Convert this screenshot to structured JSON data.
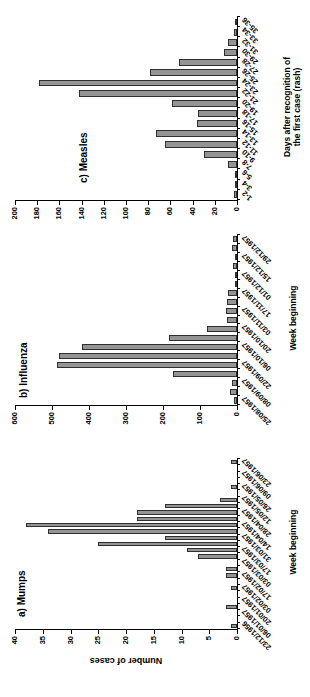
{
  "figure": {
    "y_axis_title": "Number of cases"
  },
  "chart_data": [
    {
      "type": "bar",
      "title": "a) Mumps",
      "xlabel": "Week beginning",
      "ylabel": "Number of cases",
      "ylim": [
        0,
        40
      ],
      "ytick_step": 5,
      "label_every": 2,
      "grid": false,
      "bar_color": "#949494",
      "categories": [
        "23/12/1956",
        "30/12/1956",
        "06/01/1957",
        "13/01/1957",
        "20/01/1957",
        "27/01/1957",
        "03/02/1957",
        "10/02/1957",
        "17/02/1957",
        "24/02/1957",
        "03/03/1957",
        "10/03/1957",
        "17/03/1957",
        "24/03/1957",
        "31/03/1957",
        "07/04/1957",
        "14/04/1957",
        "21/04/1957",
        "28/04/1957",
        "05/05/1957",
        "12/05/1957",
        "19/05/1957",
        "26/05/1957",
        "02/06/1957",
        "09/06/1957",
        "16/06/1957",
        "23/06/1957"
      ],
      "values": [
        1,
        0,
        0,
        2,
        0,
        0,
        1,
        0,
        2,
        2,
        0,
        7,
        9,
        25,
        13,
        34,
        38,
        18,
        18,
        13,
        3,
        0,
        1,
        0,
        0,
        0,
        1
      ]
    },
    {
      "type": "bar",
      "title": "b) Influenza",
      "xlabel": "Week beginning",
      "ylabel": "",
      "ylim": [
        0,
        600
      ],
      "ytick_step": 100,
      "label_every": 2,
      "grid": false,
      "bar_color": "#949494",
      "categories": [
        "25/08/1957",
        "01/09/1957",
        "08/09/1957",
        "15/09/1957",
        "22/09/1957",
        "29/09/1957",
        "06/10/1957",
        "13/10/1957",
        "20/10/1957",
        "27/10/1957",
        "03/11/1957",
        "10/11/1957",
        "17/11/1957",
        "24/11/1957",
        "01/12/1957",
        "08/12/1957",
        "15/12/1957",
        "22/12/1957",
        "29/12/1957"
      ],
      "values": [
        9,
        18,
        13,
        173,
        486,
        481,
        419,
        184,
        81,
        26,
        29,
        28,
        23,
        4,
        6,
        11,
        6,
        13,
        11
      ]
    },
    {
      "type": "bar",
      "title": "c) Measles",
      "xlabel_line1": "Days after recognition of",
      "xlabel_line2": "the first case (rash)",
      "ylabel": "",
      "ylim": [
        0,
        200
      ],
      "ytick_step": 20,
      "label_every": 1,
      "grid": false,
      "bar_color": "#949494",
      "categories": [
        "1-2",
        "3-4",
        "5-6",
        "7-8",
        "9-10",
        "11-12",
        "13-14",
        "15-16",
        "17-18",
        "19-20",
        "21-22",
        "23-24",
        "25-26",
        "27-28",
        "29-30",
        "31-32",
        "33-34",
        "35-36"
      ],
      "values": [
        3,
        1,
        2,
        8,
        30,
        65,
        73,
        36,
        35,
        59,
        142,
        178,
        78,
        52,
        12,
        8,
        3,
        1
      ]
    }
  ]
}
